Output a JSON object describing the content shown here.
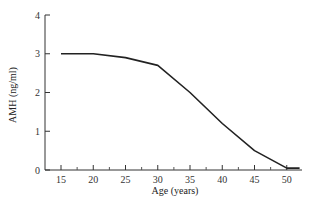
{
  "chart_data": {
    "type": "line",
    "title": "",
    "xlabel": "Age (years)",
    "ylabel": "AMH (ng/ml)",
    "x": [
      15,
      20,
      25,
      30,
      35,
      40,
      45,
      50,
      52
    ],
    "series": [
      {
        "name": "AMH",
        "values": [
          3.0,
          3.0,
          2.9,
          2.7,
          2.0,
          1.2,
          0.5,
          0.05,
          0.05
        ]
      }
    ],
    "xlim": [
      12.5,
      52.5
    ],
    "ylim": [
      0,
      4
    ],
    "xticks": [
      15,
      20,
      25,
      30,
      35,
      40,
      45,
      50
    ],
    "yticks": [
      0,
      1,
      2,
      3,
      4
    ],
    "grid": false,
    "legend": "none",
    "line_color": "#222222"
  },
  "labels": {
    "xticks": [
      "15",
      "20",
      "25",
      "30",
      "35",
      "40",
      "45",
      "50"
    ],
    "yticks": [
      "0",
      "1",
      "2",
      "3",
      "4"
    ]
  }
}
